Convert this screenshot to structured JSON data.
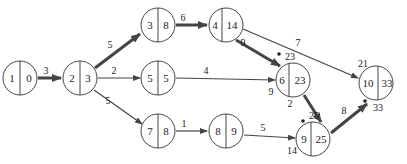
{
  "diagram": {
    "type": "activity-network",
    "nodes": [
      {
        "id": "1",
        "label": "1",
        "value": "0",
        "x": 20,
        "y": 78
      },
      {
        "id": "2",
        "label": "2",
        "value": "3",
        "x": 80,
        "y": 78
      },
      {
        "id": "3",
        "label": "3",
        "value": "8",
        "x": 158,
        "y": 25
      },
      {
        "id": "4",
        "label": "4",
        "value": "14",
        "x": 226,
        "y": 25
      },
      {
        "id": "5",
        "label": "5",
        "value": "5",
        "x": 158,
        "y": 78
      },
      {
        "id": "6",
        "label": "6",
        "value": "23",
        "x": 293,
        "y": 80
      },
      {
        "id": "7",
        "label": "7",
        "value": "8",
        "x": 158,
        "y": 131
      },
      {
        "id": "8",
        "label": "8",
        "value": "9",
        "x": 226,
        "y": 131
      },
      {
        "id": "9",
        "label": "9",
        "value": "25",
        "x": 313,
        "y": 139
      },
      {
        "id": "10",
        "label": "10",
        "value": "33",
        "x": 376,
        "y": 83
      }
    ],
    "edges": [
      {
        "from": "1",
        "to": "2",
        "weight": "3",
        "critical": true
      },
      {
        "from": "2",
        "to": "3",
        "weight": "5",
        "critical": true
      },
      {
        "from": "2",
        "to": "5",
        "weight": "2",
        "critical": false
      },
      {
        "from": "2",
        "to": "7",
        "weight": "5",
        "critical": false
      },
      {
        "from": "3",
        "to": "4",
        "weight": "6",
        "critical": true
      },
      {
        "from": "4",
        "to": "6",
        "weight": "9",
        "critical": true
      },
      {
        "from": "4",
        "to": "10",
        "weight": "7",
        "critical": false
      },
      {
        "from": "5",
        "to": "6",
        "weight": "4",
        "critical": false
      },
      {
        "from": "7",
        "to": "8",
        "weight": "1",
        "critical": false
      },
      {
        "from": "8",
        "to": "9",
        "weight": "5",
        "critical": false
      },
      {
        "from": "6",
        "to": "9",
        "weight": "2",
        "critical": true
      },
      {
        "from": "9",
        "to": "10",
        "weight": "8",
        "critical": true
      }
    ],
    "annotations": {
      "node6_in_critical": "23",
      "node6_in_other": "9",
      "node9_in_critical": "25",
      "node9_in_other": "14",
      "node10_in_other": "21",
      "node10_in_critical": "33"
    }
  }
}
